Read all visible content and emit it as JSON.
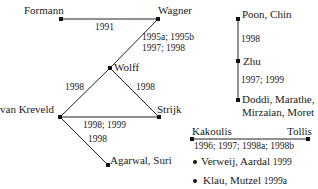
{
  "nodes": {
    "formann": "Formann",
    "wagner": "Wagner",
    "wolff": "Wolff",
    "van_kreveld": "van Kreveld",
    "strijk": "Strijk",
    "agarwal_suri": "Agarwal, Suri",
    "poon_chin": "Poon, Chin",
    "zhu": "Zhu",
    "doddi_line1": "Doddi, Marathe,",
    "doddi_line2": "Mirzaian, Moret",
    "kakoulis": "Kakoulis",
    "tollis": "Tollis"
  },
  "edges": {
    "formann_wagner": "1991",
    "wagner_wolff_line1": "1995a; 1995b",
    "wagner_wolff_line2": "1997; 1998",
    "wolff_vankreveld": "1998",
    "wolff_strijk": "1998",
    "vankreveld_strijk": "1998; 1999",
    "vankreveld_agarwal": "1998",
    "poon_zhu": "1998",
    "zhu_doddi": "1997; 1999",
    "kakoulis_tollis": "1996; 1997; 1998a; 1998b"
  },
  "singletons": [
    {
      "name": "Verweij, Aardal",
      "year": "1999"
    },
    {
      "name": "Klau, Mutzel",
      "year": "1999a"
    }
  ]
}
